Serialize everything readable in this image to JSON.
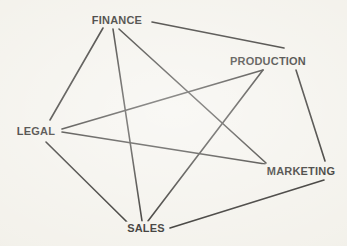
{
  "diagram": {
    "type": "network-graph",
    "background_color": "#f2f0e9",
    "line_color": "#14120e",
    "text_color": "#14120e",
    "canvas": {
      "width": 347,
      "height": 246
    },
    "nodes": [
      {
        "id": "finance",
        "label": "FINANCE",
        "x": 117,
        "y": 20,
        "label_x": 117,
        "label_y": 20,
        "halo_w": 60,
        "halo_h": 13
      },
      {
        "id": "production",
        "label": "PRODUCTION",
        "x": 268,
        "y": 61,
        "label_x": 268,
        "label_y": 61,
        "halo_w": 82,
        "halo_h": 13
      },
      {
        "id": "legal",
        "label": "LEGAL",
        "x": 36,
        "y": 131,
        "label_x": 36,
        "label_y": 131,
        "halo_w": 45,
        "halo_h": 13
      },
      {
        "id": "marketing",
        "label": "MARKETING",
        "x": 301,
        "y": 171,
        "label_x": 301,
        "label_y": 171,
        "halo_w": 80,
        "halo_h": 13
      },
      {
        "id": "sales",
        "label": "SALES",
        "x": 146,
        "y": 228,
        "label_x": 146,
        "label_y": 228,
        "halo_w": 42,
        "halo_h": 13
      }
    ],
    "edges": [
      {
        "id": "finance-legal",
        "from": "FINANCE",
        "to": "LEGAL",
        "x1": 103,
        "y1": 28,
        "x2": 50,
        "y2": 120
      },
      {
        "id": "finance-production",
        "from": "FINANCE",
        "to": "PRODUCTION",
        "x1": 152,
        "y1": 22,
        "x2": 284,
        "y2": 48
      },
      {
        "id": "finance-sales",
        "from": "FINANCE",
        "to": "SALES",
        "x1": 113,
        "y1": 29,
        "x2": 142,
        "y2": 221
      },
      {
        "id": "finance-marketing",
        "from": "FINANCE",
        "to": "MARKETING",
        "x1": 119,
        "y1": 29,
        "x2": 266,
        "y2": 163
      },
      {
        "id": "legal-production",
        "from": "LEGAL",
        "to": "PRODUCTION",
        "x1": 62,
        "y1": 129,
        "x2": 263,
        "y2": 70
      },
      {
        "id": "legal-marketing",
        "from": "LEGAL",
        "to": "MARKETING",
        "x1": 62,
        "y1": 132,
        "x2": 265,
        "y2": 164
      },
      {
        "id": "legal-sales",
        "from": "LEGAL",
        "to": "SALES",
        "x1": 46,
        "y1": 142,
        "x2": 127,
        "y2": 222
      },
      {
        "id": "production-sales",
        "from": "PRODUCTION",
        "to": "SALES",
        "x1": 263,
        "y1": 70,
        "x2": 148,
        "y2": 221
      },
      {
        "id": "production-marketing",
        "from": "PRODUCTION",
        "to": "MARKETING",
        "x1": 296,
        "y1": 70,
        "x2": 325,
        "y2": 161
      },
      {
        "id": "sales-marketing",
        "from": "SALES",
        "to": "MARKETING",
        "x1": 170,
        "y1": 228,
        "x2": 324,
        "y2": 180
      }
    ]
  }
}
